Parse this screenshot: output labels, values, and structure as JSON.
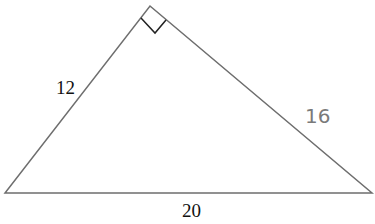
{
  "diagram": {
    "type": "right-triangle",
    "vertices": {
      "bottom_left": [
        5,
        193
      ],
      "bottom_right": [
        372,
        193
      ],
      "apex": [
        150,
        6
      ]
    },
    "right_angle_marker": {
      "points": [
        [
          141,
          18
        ],
        [
          155,
          33
        ],
        [
          166,
          20
        ]
      ]
    },
    "labels": {
      "left_side": "12",
      "right_side": "16",
      "base": "20"
    },
    "colors": {
      "line": "#6e6e6e",
      "marker": "#222222",
      "label_dark": "#111111",
      "label_grey": "#7a7a7a"
    }
  }
}
